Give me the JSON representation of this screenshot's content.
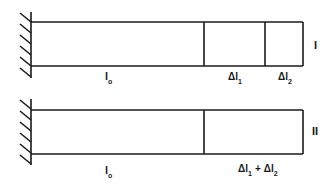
{
  "diagram": {
    "colors": {
      "line": "#1a1a1a",
      "background": "#ffffff"
    },
    "configs": [
      {
        "id": "I",
        "roman_label": "I",
        "original_length_label": {
          "base": "l",
          "sub": "o"
        },
        "segments": [
          {
            "name": "original-length",
            "label_base": "l",
            "label_sub": "o"
          },
          {
            "name": "extension-1",
            "label_prefix": "Δ",
            "label_base": "l",
            "label_sub": "1"
          },
          {
            "name": "extension-2",
            "label_prefix": "Δ",
            "label_base": "l",
            "label_sub": "2"
          }
        ]
      },
      {
        "id": "II",
        "roman_label": "II",
        "segments": [
          {
            "name": "original-length",
            "label_base": "l",
            "label_sub": "o"
          },
          {
            "name": "combined-extension",
            "label_parts": [
              "Δl",
              "1",
              " + ",
              "Δl",
              "2"
            ]
          }
        ]
      }
    ],
    "text": {
      "I_label": "I",
      "II_label": "II",
      "l": "l",
      "o": "o",
      "delta": "Δ",
      "sub1": "1",
      "sub2": "2",
      "plus": "+"
    }
  }
}
